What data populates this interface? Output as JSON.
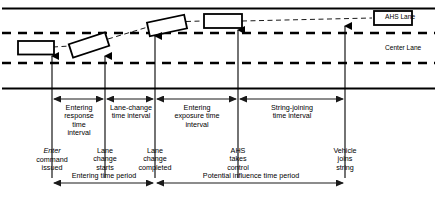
{
  "road": {
    "lane_labels": [
      {
        "name": "ahs-lane",
        "text": "AHS Lane"
      },
      {
        "name": "center-lane",
        "text": "Center Lane"
      }
    ]
  },
  "vehicles": [
    {
      "name": "vehicle-pos-1",
      "state": "in center lane, upright"
    },
    {
      "name": "vehicle-pos-2",
      "state": "tilted, beginning lane change"
    },
    {
      "name": "vehicle-pos-3",
      "state": "tilted, crossing lane line"
    },
    {
      "name": "vehicle-pos-4",
      "state": "upright in AHS lane"
    },
    {
      "name": "vehicle-pos-5",
      "state": "upright in AHS lane, joined string"
    }
  ],
  "intervals": [
    {
      "name": "entering-response-time-interval",
      "label": "Entering\nresponse\ntime\ninterval"
    },
    {
      "name": "lane-change-time-interval",
      "label": "Lane-change\ntime interval"
    },
    {
      "name": "entering-exposure-time-interval",
      "label": "Entering\nexposure time\ninterval"
    },
    {
      "name": "string-joining-time-interval",
      "label": "String-joining\ntime interval"
    }
  ],
  "events": [
    {
      "name": "event-enter-command-issued",
      "italic_word": "Enter",
      "rest": "command\nissued"
    },
    {
      "name": "event-lane-change-starts",
      "label": "Lane\nchange\nstarts"
    },
    {
      "name": "event-lane-change-completed",
      "label": "Lane\nchange\ncompleted"
    },
    {
      "name": "event-ahs-takes-control",
      "label": "AHS\ntakes\ncontrol"
    },
    {
      "name": "event-vehicle-joins-string",
      "label": "Vehicle\njoins\nstring"
    }
  ],
  "periods": [
    {
      "name": "entering-time-period",
      "label": "Entering time period"
    },
    {
      "name": "potential-influence-time-period",
      "label": "Potential influence time period"
    }
  ],
  "colors": {
    "stroke": "#000000",
    "background": "#ffffff",
    "arrow": "#1a1a1a"
  }
}
